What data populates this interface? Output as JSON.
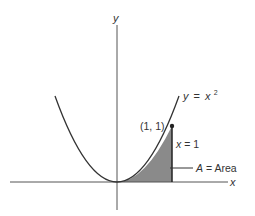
{
  "diagram": {
    "type": "function-area-plot",
    "function": "y = x^2",
    "axes": {
      "x_label": "x",
      "y_label": "y"
    },
    "curve_label": {
      "lhs": "y",
      "eq": "=",
      "base": "x",
      "exponent": "2"
    },
    "point": {
      "label": "(1, 1)",
      "x": 1,
      "y": 1
    },
    "vertical_line_label": {
      "var": "x",
      "rest": " = 1"
    },
    "area_label": {
      "var": "A",
      "rest": " = Area"
    },
    "colors": {
      "curve": "#333333",
      "axes": "#555555",
      "shaded_area": "#8a8a8a",
      "text": "#333333"
    }
  }
}
